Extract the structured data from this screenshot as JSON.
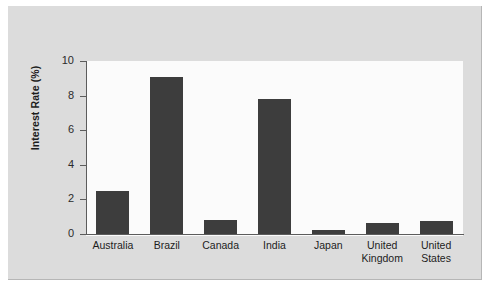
{
  "chart_data": {
    "type": "bar",
    "title": "",
    "xlabel": "",
    "ylabel": "Interest Rate (%)",
    "ylim": [
      0,
      10
    ],
    "ytick_values": [
      0,
      2,
      4,
      6,
      8,
      10
    ],
    "ytick_labels": [
      "0",
      "2",
      "4",
      "6",
      "8",
      "10"
    ],
    "grid": false,
    "legend": null,
    "bar_color": "#3d3d3d",
    "plot_background": "#fbfbfb",
    "figure_background": "#dcdcdc",
    "axis_color": "#5c5c5c",
    "categories": [
      "Australia",
      "Brazil",
      "Canada",
      "India",
      "Japan",
      "United Kingdom",
      "United States"
    ],
    "category_labels": [
      "Australia",
      "Brazil",
      "Canada",
      "India",
      "Japan",
      "United\nKingdom",
      "United\nStates"
    ],
    "values": [
      2.5,
      9.05,
      0.8,
      7.8,
      0.25,
      0.65,
      0.75
    ]
  }
}
